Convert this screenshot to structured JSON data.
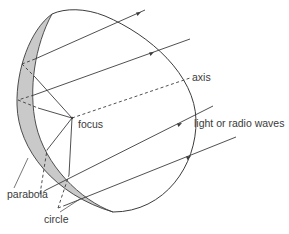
{
  "diagram": {
    "labels": {
      "axis": "axis",
      "focus": "focus",
      "waves": "light or radio waves",
      "parabola": "parabola",
      "circle": "circle"
    },
    "colors": {
      "line": "#3c3c3c",
      "shading": "#c9c9c9",
      "text": "#3a3a3a"
    },
    "focus_point": [
      72,
      118
    ],
    "rays": [
      {
        "from": [
          145,
          10
        ],
        "to": [
          35,
          59
        ]
      },
      {
        "from": [
          190,
          40
        ],
        "to": [
          32,
          96
        ]
      },
      {
        "from": [
          232,
          110
        ],
        "to": [
          43,
          193
        ]
      },
      {
        "from": [
          240,
          140
        ],
        "to": [
          66,
          205
        ]
      }
    ]
  }
}
